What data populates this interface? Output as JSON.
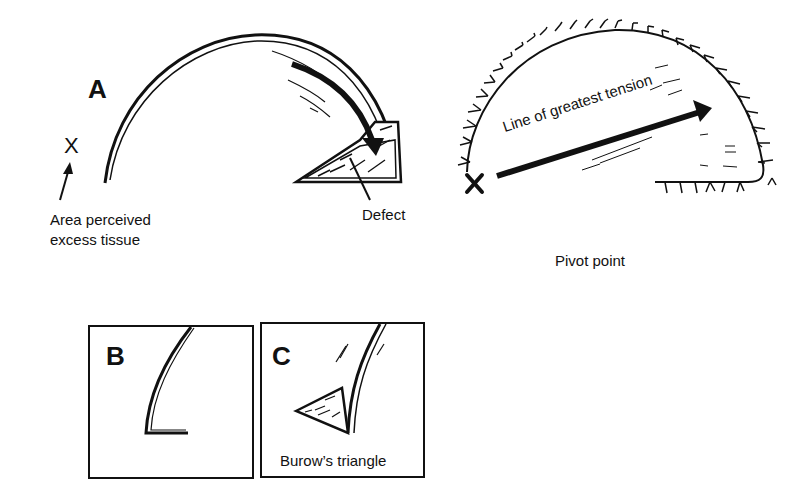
{
  "panel_a": {
    "letter": "A",
    "marker": "X",
    "excess_label_line1": "Area perceived",
    "excess_label_line2": "excess tissue",
    "defect_label": "Defect"
  },
  "panel_right": {
    "tension_label": "Line of greatest tension",
    "pivot_marker": "X",
    "pivot_label": "Pivot point"
  },
  "panel_b": {
    "letter": "B"
  },
  "panel_c": {
    "letter": "C",
    "caption": "Burow’s triangle"
  },
  "colors": {
    "ink": "#111111",
    "background": "#ffffff"
  }
}
